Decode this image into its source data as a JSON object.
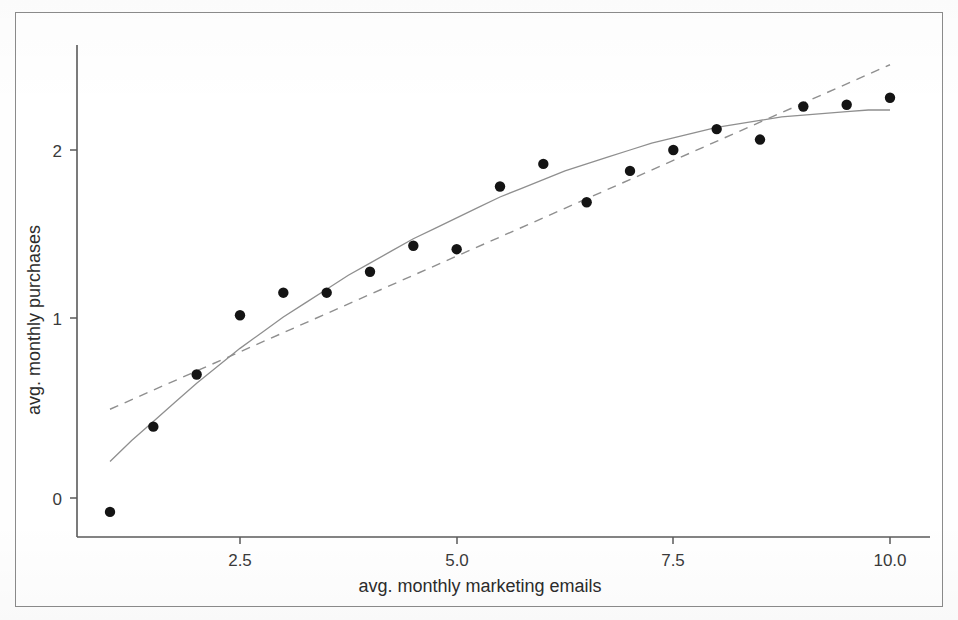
{
  "figure": {
    "background_color": "#ffffff",
    "frame_color": "#8b8b8b",
    "point_color": "#141414",
    "line_color": "#8f8f8f"
  },
  "chart_data": {
    "type": "scatter",
    "title": "",
    "subtitle": "",
    "xlabel": "avg. monthly marketing emails",
    "ylabel": "avg. monthly purchases",
    "xlim": [
      0.55,
      10.45
    ],
    "ylim": [
      -0.32,
      2.55
    ],
    "xticks": [
      2.5,
      5.0,
      7.5,
      10.0
    ],
    "xtick_labels": [
      "2.5",
      "5.0",
      "7.5",
      "10.0"
    ],
    "yticks": [
      0,
      1,
      2
    ],
    "ytick_labels": [
      "0",
      "1",
      "2"
    ],
    "grid": false,
    "legend": null,
    "legend_position": "none",
    "points": {
      "name": "observations",
      "marker": "filled-circle",
      "x": [
        1.0,
        1.5,
        2.0,
        2.5,
        3.0,
        3.5,
        4.0,
        4.5,
        5.0,
        5.5,
        6.0,
        6.5,
        7.0,
        7.5,
        8.0,
        8.5,
        9.0,
        9.5,
        10.0
      ],
      "y": [
        -0.08,
        0.41,
        0.71,
        1.05,
        1.18,
        1.18,
        1.3,
        1.45,
        1.43,
        1.79,
        1.92,
        1.7,
        1.88,
        2.0,
        2.12,
        2.06,
        2.25,
        2.26,
        2.3
      ]
    },
    "series": [
      {
        "name": "smooth-fit",
        "style": "solid",
        "x": [
          1.0,
          1.25,
          1.5,
          1.75,
          2.0,
          2.25,
          2.5,
          2.75,
          3.0,
          3.25,
          3.5,
          3.75,
          4.0,
          4.25,
          4.5,
          4.75,
          5.0,
          5.25,
          5.5,
          5.75,
          6.0,
          6.25,
          6.5,
          6.75,
          7.0,
          7.25,
          7.5,
          7.75,
          8.0,
          8.25,
          8.5,
          8.75,
          9.0,
          9.25,
          9.5,
          9.75,
          10.0
        ],
        "y": [
          0.21,
          0.33,
          0.44,
          0.55,
          0.66,
          0.76,
          0.86,
          0.95,
          1.04,
          1.12,
          1.2,
          1.28,
          1.35,
          1.42,
          1.49,
          1.55,
          1.61,
          1.67,
          1.73,
          1.78,
          1.83,
          1.88,
          1.92,
          1.96,
          2.0,
          2.04,
          2.07,
          2.1,
          2.13,
          2.15,
          2.17,
          2.19,
          2.2,
          2.21,
          2.22,
          2.23,
          2.23
        ]
      },
      {
        "name": "linear-fit",
        "style": "dashed",
        "x": [
          1.0,
          10.0
        ],
        "y": [
          0.51,
          2.49
        ]
      }
    ]
  },
  "axes": {
    "x_axis_name": "x-axis",
    "y_axis_name": "y-axis"
  }
}
